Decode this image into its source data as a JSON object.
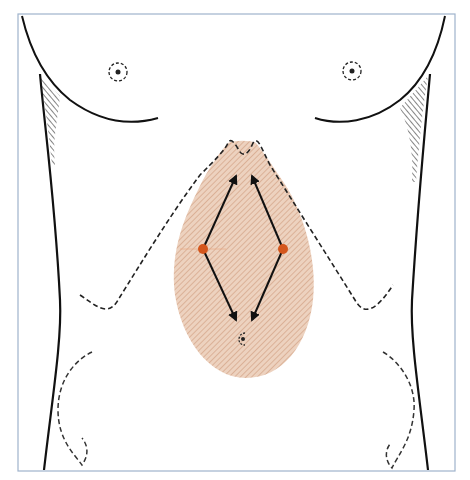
{
  "figure": {
    "colors": {
      "outline": "#111111",
      "frame": "#9fb3cc",
      "shaded_region": "#e9c3a8",
      "hatch": "#c98f6e",
      "port_marker": "#d4561c",
      "arrow": "#111111",
      "dashed": "#333333"
    },
    "markers": [
      {
        "name": "left-port",
        "cx": 203,
        "cy": 249
      },
      {
        "name": "right-port",
        "cx": 283,
        "cy": 249
      }
    ],
    "arrows": [
      {
        "name": "left-upper-arrow",
        "from": [
          203,
          249
        ],
        "to": [
          236,
          176
        ]
      },
      {
        "name": "right-upper-arrow",
        "from": [
          283,
          249
        ],
        "to": [
          252,
          176
        ]
      },
      {
        "name": "left-lower-arrow",
        "from": [
          203,
          249
        ],
        "to": [
          236,
          320
        ]
      },
      {
        "name": "right-lower-arrow",
        "from": [
          283,
          249
        ],
        "to": [
          252,
          320
        ]
      }
    ]
  }
}
